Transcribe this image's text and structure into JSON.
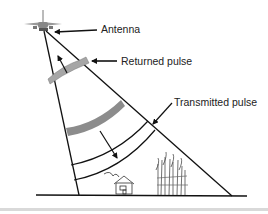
{
  "diagram": {
    "labels": {
      "antenna": "Antenna",
      "returned_pulse": "Returned pulse",
      "transmitted_pulse": "Transmitted pulse"
    },
    "icons": {
      "aircraft": "airplane-icon",
      "house": "house-icon",
      "trees": "trees-icon"
    },
    "colors": {
      "line": "#111111",
      "pulse_band": "#8c8c8c",
      "returned_band": "#a6a6a6",
      "background": "#ffffff",
      "separator": "#d9d9d9"
    }
  }
}
